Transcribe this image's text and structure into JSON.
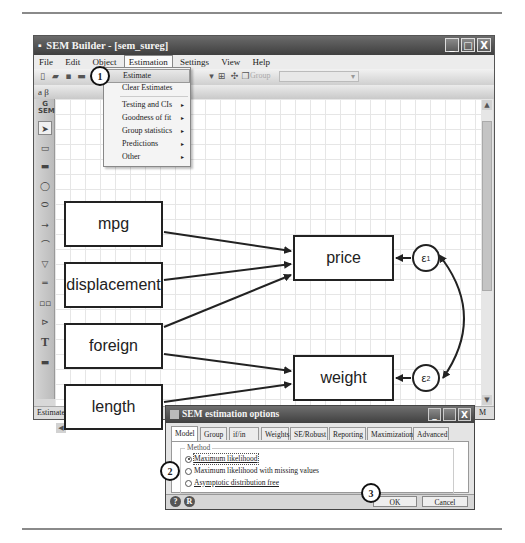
{
  "window": {
    "title": "SEM Builder - [sem_sureg]",
    "controls": {
      "minimize": "_",
      "maximize": "□",
      "close": "X"
    }
  },
  "menubar": {
    "items": [
      {
        "label": "File"
      },
      {
        "label": "Edit"
      },
      {
        "label": "Object"
      },
      {
        "label": "Estimation",
        "active": true
      },
      {
        "label": "Settings"
      },
      {
        "label": "View"
      },
      {
        "label": "Help"
      }
    ]
  },
  "toolbar": {
    "group_label": "Group",
    "group_select_value": ""
  },
  "toolbar2": {
    "label": "a β"
  },
  "palette": {
    "header": "G SEM",
    "tools": [
      "select-tool",
      "observed-variable-tool",
      "observed-variable-tool-2",
      "latent-variable-tool",
      "latent-variable-tool-2",
      "path-tool",
      "covariance-tool",
      "measurement-component-tool",
      "regression-component-tool",
      "regression-component-tool-2",
      "latent-component-tool",
      "text-tool",
      "area-tool"
    ]
  },
  "estimation_menu": {
    "items": [
      {
        "label": "Estimate",
        "highlighted": true,
        "submenu": false
      },
      {
        "label": "Clear Estimates",
        "submenu": false
      },
      {
        "label": "Testing and CIs",
        "submenu": true
      },
      {
        "label": "Goodness of fit",
        "submenu": true
      },
      {
        "label": "Group statistics",
        "submenu": true
      },
      {
        "label": "Predictions",
        "submenu": true
      },
      {
        "label": "Other",
        "submenu": true
      }
    ]
  },
  "diagram": {
    "observed_exogenous": [
      "mpg",
      "displacement",
      "foreign",
      "length"
    ],
    "observed_endogenous": [
      "price",
      "weight"
    ],
    "errors": [
      {
        "label": "ε",
        "sub": "1"
      },
      {
        "label": "ε",
        "sub": "2"
      }
    ]
  },
  "statusbar": {
    "text": "Estimate",
    "right": "M"
  },
  "dialog": {
    "title": "SEM estimation options",
    "tabs": [
      "Model",
      "Group",
      "if/in",
      "Weights",
      "SE/Robust",
      "Reporting",
      "Maximization",
      "Advanced"
    ],
    "active_tab": "Model",
    "method_legend": "Method",
    "methods": [
      {
        "label": "Maximum likelihood",
        "selected": true
      },
      {
        "label": "Maximum likelihood with missing values",
        "selected": false
      },
      {
        "label": "Asymptotic distribution free",
        "selected": false
      }
    ],
    "buttons": {
      "ok": "OK",
      "cancel": "Cancel"
    },
    "footer_icons": {
      "help": "?",
      "reset": "R"
    }
  },
  "callouts": [
    "1",
    "2",
    "3"
  ],
  "icons": {
    "arrow-right": "▸",
    "scroll-up": "▲",
    "scroll-down": "▼",
    "scroll-left": "◀",
    "scroll-right": "▶"
  }
}
